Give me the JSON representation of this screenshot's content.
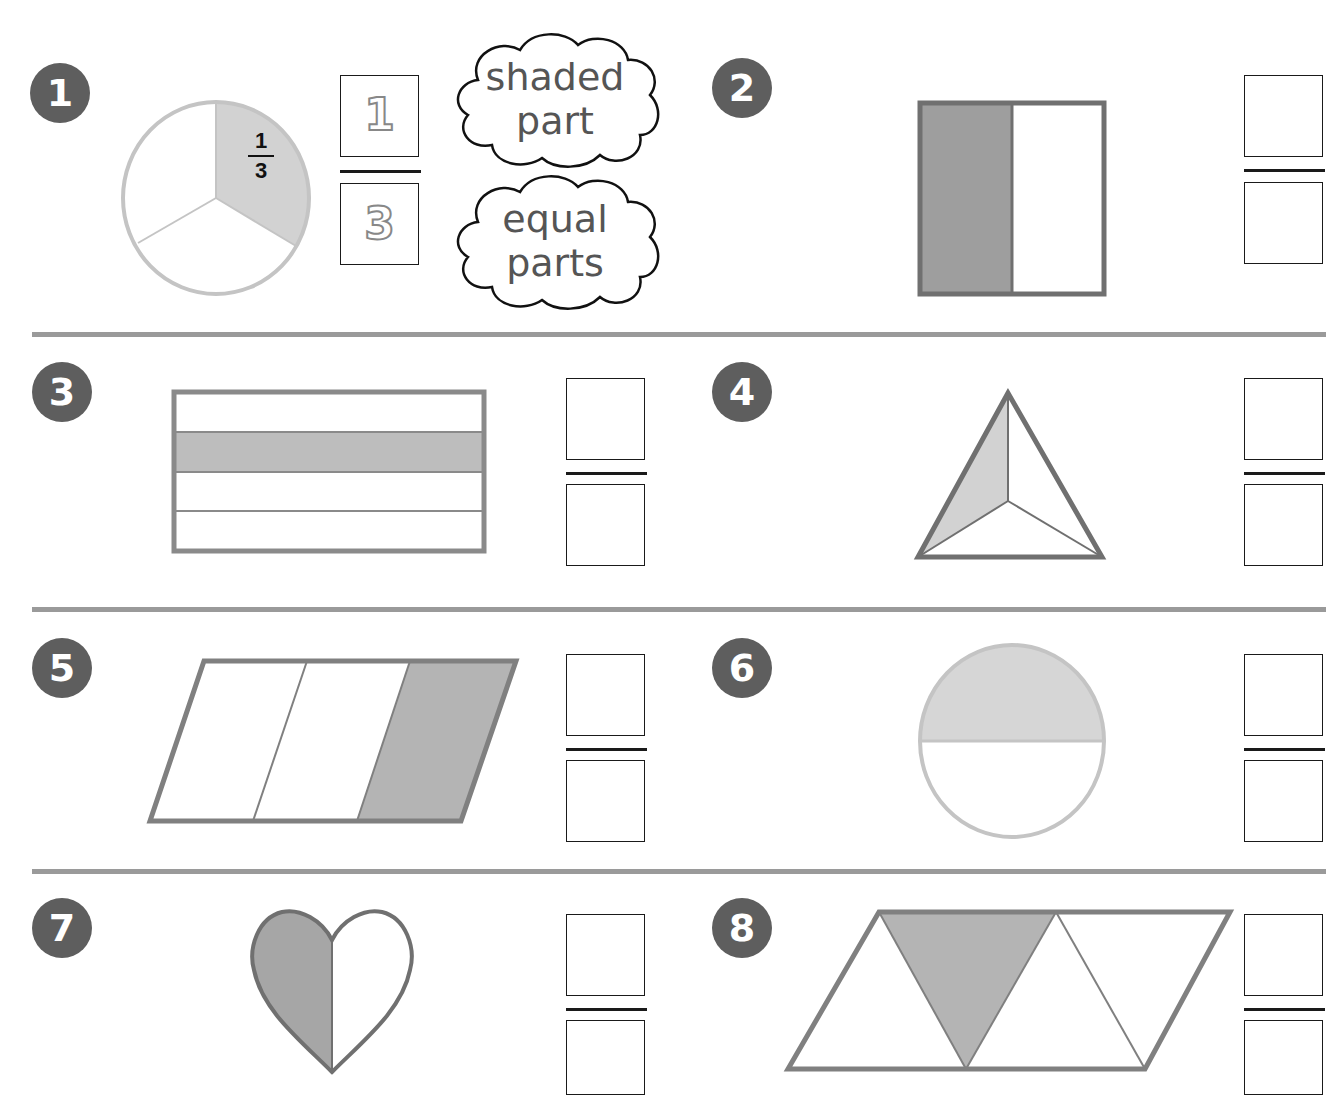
{
  "worksheet": {
    "colors": {
      "badge": "#5e5e5e",
      "shade_dark": "#9e9e9e",
      "shade_light": "#d2d2d2",
      "outline_dark": "#707070",
      "outline_light": "#c4c4c4",
      "divider": "#9a9a9a",
      "box_border": "#1a1a1a"
    },
    "example": {
      "number": "1",
      "label_numerator": "1",
      "label_denominator": "3",
      "answer_numerator": "1",
      "answer_denominator": "3",
      "cloud_top": [
        "shaded",
        "part"
      ],
      "cloud_bottom": [
        "equal",
        "parts"
      ]
    },
    "problems": [
      {
        "number": "1",
        "shape": "circle split in 3",
        "shaded": 1,
        "parts": 3
      },
      {
        "number": "2",
        "shape": "rectangle split vertically in 2",
        "shaded": 1,
        "parts": 2
      },
      {
        "number": "3",
        "shape": "rectangle split horizontally in 4",
        "shaded": 1,
        "parts": 4
      },
      {
        "number": "4",
        "shape": "triangle split in 3",
        "shaded": 1,
        "parts": 3
      },
      {
        "number": "5",
        "shape": "parallelogram split in 3",
        "shaded": 1,
        "parts": 3
      },
      {
        "number": "6",
        "shape": "circle split in 2",
        "shaded": 1,
        "parts": 2
      },
      {
        "number": "7",
        "shape": "heart split in 2",
        "shaded": 1,
        "parts": 2
      },
      {
        "number": "8",
        "shape": "parallelogram split into 3 triangles",
        "shaded": 1,
        "parts": 3
      }
    ]
  }
}
